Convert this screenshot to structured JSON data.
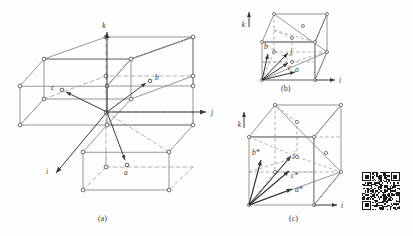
{
  "figure": {
    "title_caption_a": "(a)",
    "title_caption_b": "(b)",
    "title_caption_c": "(c)",
    "background_color": "#ffffff",
    "line_color": "#8a8a8a",
    "dash_color": "#9a9a9a",
    "node_color": "#606060",
    "vector_color": "#3a3a3a",
    "text_color": "#2f2f2f"
  },
  "panel_a": {
    "caption": "(a)",
    "axes": [
      {
        "name": "k-axis",
        "label": "k"
      },
      {
        "name": "j-axis",
        "label": "j"
      },
      {
        "name": "i-axis",
        "label": "i"
      }
    ],
    "vectors": [
      {
        "name": "vector-a",
        "label": "a"
      },
      {
        "name": "vector-b",
        "label": "b"
      },
      {
        "name": "vector-c",
        "label": "c"
      }
    ]
  },
  "panel_b": {
    "caption": "(b)",
    "axes": [
      {
        "name": "k-axis",
        "label": "k"
      },
      {
        "name": "i-axis",
        "label": "i"
      }
    ],
    "vectors": [
      {
        "name": "vector-a",
        "label": "a"
      },
      {
        "name": "vector-b",
        "label": "b"
      },
      {
        "name": "vector-c",
        "label": "c"
      },
      {
        "name": "vector-j",
        "label": "j"
      }
    ]
  },
  "panel_c": {
    "caption": "(c)",
    "axes": [
      {
        "name": "k-axis",
        "label": "k"
      },
      {
        "name": "i-axis",
        "label": "i"
      }
    ],
    "vectors": [
      {
        "name": "vector-a-star",
        "label": "a*"
      },
      {
        "name": "vector-b-star",
        "label": "b*"
      },
      {
        "name": "vector-c-star",
        "label": "c*"
      },
      {
        "name": "vector-j",
        "label": "j"
      }
    ]
  },
  "qr_code": {
    "name": "qr-code",
    "present": true,
    "modules": 29
  }
}
